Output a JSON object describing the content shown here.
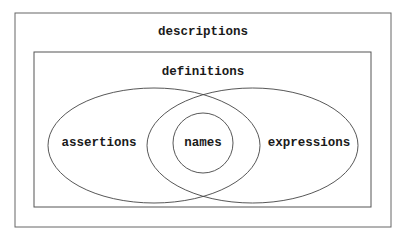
{
  "diagram": {
    "outer_box": {
      "label": "descriptions"
    },
    "inner_box": {
      "label": "definitions"
    },
    "left_set": {
      "label": "assertions"
    },
    "center_set": {
      "label": "names"
    },
    "right_set": {
      "label": "expressions"
    }
  },
  "colors": {
    "stroke": "#555555",
    "text": "#1a1a1a",
    "background": "#ffffff"
  }
}
